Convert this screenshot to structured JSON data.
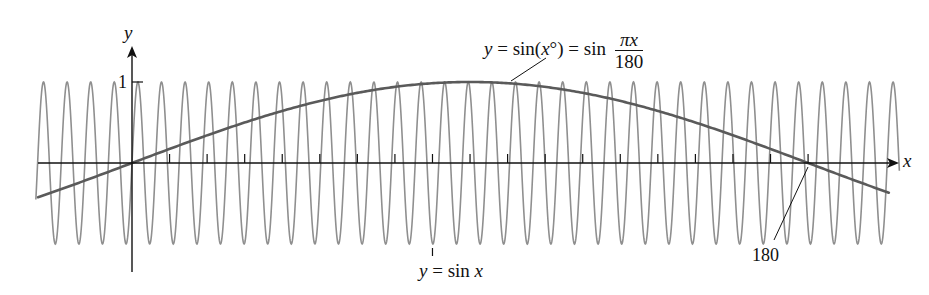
{
  "chart_data": {
    "type": "line",
    "title": "",
    "xlabel": "x",
    "ylabel": "y",
    "grid": false,
    "legend": "none (curves labeled by callouts)",
    "xlim": [
      -25,
      205
    ],
    "ylim": [
      -1.4,
      1.45
    ],
    "x_ticks_every": 10,
    "x_tick_labels": [
      {
        "x": 180,
        "label": "180"
      }
    ],
    "y_tick_labels": [
      {
        "y": 1,
        "label": "1"
      }
    ],
    "series": [
      {
        "name": "y = sin(x°) = sin πx/180",
        "formula": "sin(pi*x/180)",
        "color": "#5a5a5a",
        "stroke_width": 2.6,
        "x": [
          -25,
          0,
          30,
          60,
          90,
          120,
          150,
          180,
          205
        ],
        "y": [
          -0.42,
          0,
          0.5,
          0.87,
          1,
          0.87,
          0.5,
          0,
          -0.42
        ]
      },
      {
        "name": "y = sin x",
        "formula": "sin(x)",
        "color": "#8f8f8f",
        "stroke_width": 1.6,
        "period": 6.283,
        "amplitude": 1,
        "x_range": [
          -25,
          205
        ]
      }
    ],
    "annotations": [
      {
        "text": "y = sin(x°) = sin πx/180",
        "points_to": "slow curve near x≈95"
      },
      {
        "text": "y = sin x",
        "points_to": "fast curve near x≈80"
      },
      {
        "text": "180",
        "points_to": "x-axis at x=180"
      }
    ]
  },
  "labels": {
    "y_axis": "y",
    "x_axis": "x",
    "y_one": "1",
    "label_180": "180",
    "slow_curve": {
      "y": "y",
      "eq1": "=",
      "sin1": "sin(",
      "xvar": "x",
      "deg": "°)",
      "eq2": "=",
      "sin2": "sin",
      "frac_num_pi": "π",
      "frac_num_x": "x",
      "frac_den": "180"
    },
    "fast_curve": {
      "y": "y",
      "eq": "=",
      "sin": "sin",
      "xvar": "x"
    }
  },
  "colors": {
    "axis": "#111111",
    "slow_curve": "#5a5a5a",
    "fast_curve": "#8f8f8f",
    "text": "#111111"
  }
}
